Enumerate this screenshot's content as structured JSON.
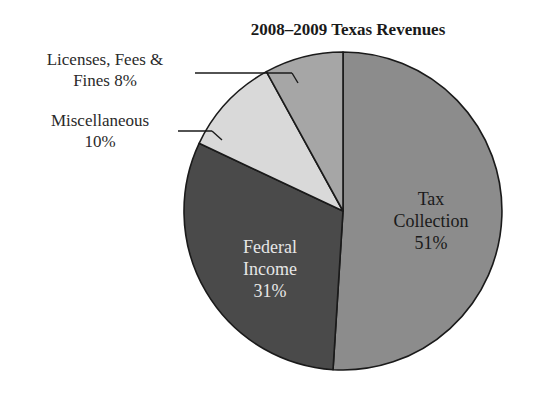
{
  "chart_data": {
    "type": "pie",
    "title": "2008–2009 Texas Revenues",
    "start_angle_deg": 0,
    "direction": "clockwise",
    "slices": [
      {
        "label": "Tax Collection",
        "value": 51,
        "display": "51%",
        "color": "#8c8c8c",
        "label_placement": "inside",
        "text_color": "#1a1a1a"
      },
      {
        "label": "Federal Income",
        "value": 31,
        "display": "31%",
        "color": "#4a4a4a",
        "label_placement": "inside",
        "text_color": "#e6e6e6"
      },
      {
        "label": "Miscellaneous",
        "value": 10,
        "display": "10%",
        "color": "#d9d9d9",
        "label_placement": "outside"
      },
      {
        "label": "Licenses, Fees & Fines",
        "value": 8,
        "display": "8%",
        "color": "#a6a6a6",
        "label_placement": "outside"
      }
    ]
  },
  "title": "2008–2009 Texas Revenues",
  "labels": {
    "tax": {
      "line1": "Tax",
      "line2": "Collection",
      "line3": "51%"
    },
    "federal": {
      "line1": "Federal",
      "line2": "Income",
      "line3": "31%"
    },
    "misc": {
      "line1": "Miscellaneous",
      "line2": "10%"
    },
    "licenses": {
      "line1": "Licenses, Fees &",
      "line2": "Fines 8%"
    }
  }
}
